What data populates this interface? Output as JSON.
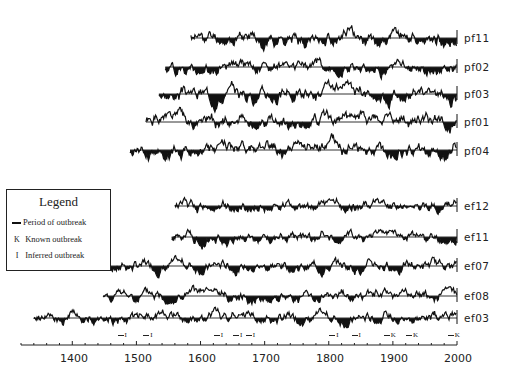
{
  "chart_data": {
    "type": "line",
    "title": "",
    "xlabel": "",
    "ylabel": "",
    "xlim": [
      1320,
      2000
    ],
    "x_ticks": [
      1400,
      1500,
      1600,
      1700,
      1800,
      1900,
      2000
    ],
    "x_tick_labels": [
      "1400",
      "1500",
      "1600",
      "1700",
      "1800",
      "1900",
      "2000"
    ],
    "minor_tick_step": 20,
    "grid": false,
    "fill_below_baseline": true,
    "series": [
      {
        "name": "pf11",
        "start": 1585,
        "end": 2000,
        "baseline_y": 38,
        "seed": 11,
        "amp": 9
      },
      {
        "name": "pf02",
        "start": 1545,
        "end": 2000,
        "baseline_y": 67,
        "seed": 2,
        "amp": 8
      },
      {
        "name": "pf03",
        "start": 1535,
        "end": 2000,
        "baseline_y": 94,
        "seed": 3,
        "amp": 9
      },
      {
        "name": "pf01",
        "start": 1515,
        "end": 2000,
        "baseline_y": 122,
        "seed": 1,
        "amp": 9
      },
      {
        "name": "pf04",
        "start": 1490,
        "end": 2000,
        "baseline_y": 150,
        "seed": 4,
        "amp": 9
      },
      {
        "name": "ef12",
        "start": 1560,
        "end": 2000,
        "baseline_y": 206,
        "seed": 12,
        "amp": 7
      },
      {
        "name": "ef11",
        "start": 1555,
        "end": 2000,
        "baseline_y": 237,
        "seed": 21,
        "amp": 7
      },
      {
        "name": "ef07",
        "start": 1450,
        "end": 2000,
        "baseline_y": 266,
        "seed": 7,
        "amp": 7
      },
      {
        "name": "ef08",
        "start": 1448,
        "end": 2000,
        "baseline_y": 296,
        "seed": 8,
        "amp": 7
      },
      {
        "name": "ef03",
        "start": 1340,
        "end": 2000,
        "baseline_y": 318,
        "seed": 33,
        "amp": 7
      }
    ],
    "outbreaks": [
      {
        "year": 1480,
        "type": "I"
      },
      {
        "year": 1520,
        "type": "I"
      },
      {
        "year": 1630,
        "type": "I"
      },
      {
        "year": 1660,
        "type": "I"
      },
      {
        "year": 1680,
        "type": "I"
      },
      {
        "year": 1810,
        "type": "I"
      },
      {
        "year": 1845,
        "type": "I"
      },
      {
        "year": 1895,
        "type": "K"
      },
      {
        "year": 1930,
        "type": "K"
      },
      {
        "year": 1995,
        "type": "K"
      }
    ],
    "legend": {
      "title": "Legend",
      "entries": [
        {
          "symbol": "—",
          "label": "Period of outbreak"
        },
        {
          "symbol": "K",
          "label": "Known outbreak"
        },
        {
          "symbol": "I",
          "label": "Inferred outbreak"
        }
      ],
      "position": "left-middle"
    }
  },
  "legend": {
    "title": "Legend",
    "period_label": "Period of outbreak",
    "known_symbol": "K",
    "known_label": "Known outbreak",
    "inferred_symbol": "I",
    "inferred_label": "Inferred outbreak"
  },
  "labels": [
    "pf11",
    "pf02",
    "pf03",
    "pf01",
    "pf04",
    "ef12",
    "ef11",
    "ef07",
    "ef08",
    "ef03"
  ],
  "ticks": [
    "1400",
    "1500",
    "1600",
    "1700",
    "1800",
    "1900",
    "2000"
  ]
}
